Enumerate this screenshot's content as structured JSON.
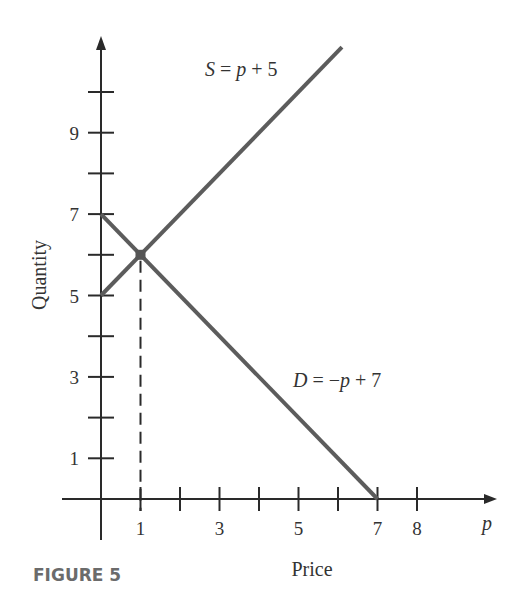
{
  "chart_data": {
    "type": "line",
    "figure_label": "FIGURE 5",
    "xlabel": "Price",
    "ylabel": "Quantity",
    "x_axis_symbol": "p",
    "xlim": [
      0,
      9.8
    ],
    "ylim": [
      0,
      11.2
    ],
    "x_ticks": [
      1,
      2,
      3,
      4,
      5,
      6,
      7,
      8
    ],
    "x_tick_labels": [
      {
        "value": 1,
        "label": "1"
      },
      {
        "value": 3,
        "label": "3"
      },
      {
        "value": 5,
        "label": "5"
      },
      {
        "value": 7,
        "label": "7"
      },
      {
        "value": 8,
        "label": "8"
      }
    ],
    "y_ticks": [
      1,
      2,
      3,
      4,
      5,
      6,
      7,
      8,
      9,
      10
    ],
    "y_tick_labels": [
      {
        "value": 1,
        "label": "1"
      },
      {
        "value": 3,
        "label": "3"
      },
      {
        "value": 5,
        "label": "5"
      },
      {
        "value": 7,
        "label": "7"
      },
      {
        "value": 9,
        "label": "9"
      }
    ],
    "grid": false,
    "series": [
      {
        "name": "Supply",
        "label_parts": [
          "S",
          " = ",
          "p",
          " + 5"
        ],
        "equation": "S = p + 5",
        "x": [
          0,
          6.1
        ],
        "y": [
          5,
          11.1
        ]
      },
      {
        "name": "Demand",
        "label_parts": [
          "D",
          " = −",
          "p",
          " + 7"
        ],
        "equation": "D = -p + 7",
        "x": [
          0,
          7
        ],
        "y": [
          7,
          0
        ]
      }
    ],
    "annotations": [
      {
        "type": "point",
        "name": "equilibrium",
        "x": 1,
        "y": 6
      },
      {
        "type": "dashed-vertical",
        "name": "equilibrium-price-guide",
        "x": 1,
        "y_from": 0,
        "y_to": 6
      }
    ]
  }
}
